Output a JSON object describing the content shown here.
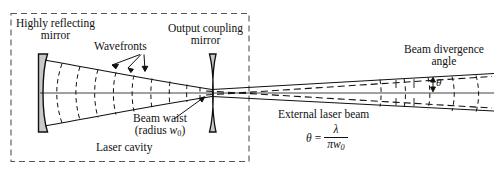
{
  "figure": {
    "type": "optics-diagram"
  },
  "labels": {
    "highly_reflecting_mirror_line1": "Highly reflecting",
    "highly_reflecting_mirror_line2": "mirror",
    "output_coupling_mirror_line1": "Output coupling",
    "output_coupling_mirror_line2": "mirror",
    "wavefronts": "Wavefronts",
    "beam_divergence_line1": "Beam divergence",
    "beam_divergence_line2": "angle",
    "beam_waist_line1": "Beam waist",
    "beam_waist_line2_pre": "(radius ",
    "beam_waist_symbol": "w",
    "beam_waist_symbol_sub": "0",
    "beam_waist_line2_post": ")",
    "laser_cavity": "Laser cavity",
    "external_laser_beam": "External laser beam",
    "theta_symbol": "θ"
  },
  "formula": {
    "lhs": "θ",
    "equals": "=",
    "numerator": "λ",
    "denominator_pi": "π",
    "denominator_w": "w",
    "denominator_sub": "0",
    "plain": "θ = λ / (πw₀)"
  },
  "colors": {
    "stroke": "#111111",
    "mirror_fill": "#c9c9c9",
    "background": "#ffffff",
    "dashed_border": "#555555"
  }
}
